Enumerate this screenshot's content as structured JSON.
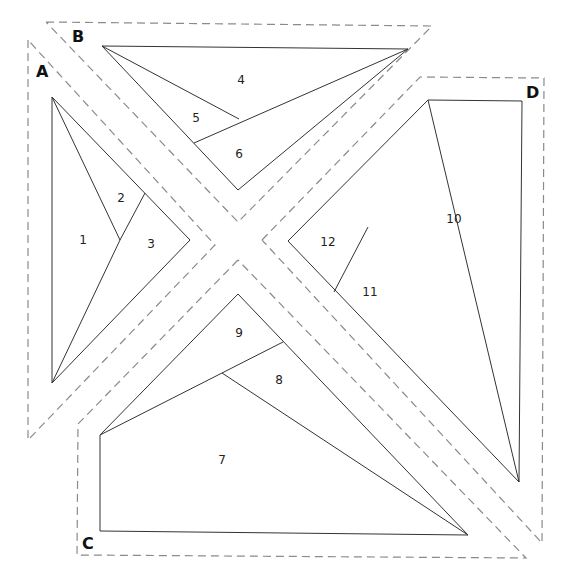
{
  "diagram": {
    "type": "foundation paper piecing pattern",
    "sections": [
      {
        "label": "A",
        "pieces": [
          "1",
          "2",
          "3"
        ]
      },
      {
        "label": "B",
        "pieces": [
          "4",
          "5",
          "6"
        ]
      },
      {
        "label": "C",
        "pieces": [
          "7",
          "8",
          "9"
        ]
      },
      {
        "label": "D",
        "pieces": [
          "10",
          "11",
          "12"
        ]
      }
    ],
    "labels": {
      "A": "A",
      "B": "B",
      "C": "C",
      "D": "D",
      "p1": "1",
      "p2": "2",
      "p3": "3",
      "p4": "4",
      "p5": "5",
      "p6": "6",
      "p7": "7",
      "p8": "8",
      "p9": "9",
      "p10": "10",
      "p11": "11",
      "p12": "12"
    },
    "colors": {
      "seam_allowance": "#8a8a8a",
      "piece_lines": "#333333",
      "background": "#ffffff"
    }
  }
}
